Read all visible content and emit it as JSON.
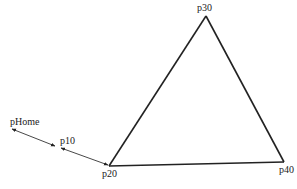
{
  "diagram": {
    "type": "robot-path",
    "background": "#ffffff",
    "line_color": "#222222",
    "points": [
      {
        "id": "pHome",
        "label": "pHome",
        "x": 12,
        "y": 129
      },
      {
        "id": "p10",
        "label": "p10",
        "x": 58,
        "y": 147
      },
      {
        "id": "p20",
        "label": "p20",
        "x": 109,
        "y": 166
      },
      {
        "id": "p30",
        "label": "p30",
        "x": 206,
        "y": 16
      },
      {
        "id": "p40",
        "label": "p40",
        "x": 284,
        "y": 162
      }
    ],
    "segments": [
      {
        "from": "pHome",
        "to": "p10",
        "style": "arrow-both"
      },
      {
        "from": "p10",
        "to": "p20",
        "style": "arrow-both"
      },
      {
        "from": "p20",
        "to": "p30",
        "style": "solid"
      },
      {
        "from": "p30",
        "to": "p40",
        "style": "solid"
      },
      {
        "from": "p40",
        "to": "p20",
        "style": "solid"
      }
    ],
    "labels": {
      "pHome": "pHome",
      "p10": "p10",
      "p20": "p20",
      "p30": "p30",
      "p40": "p40"
    }
  }
}
